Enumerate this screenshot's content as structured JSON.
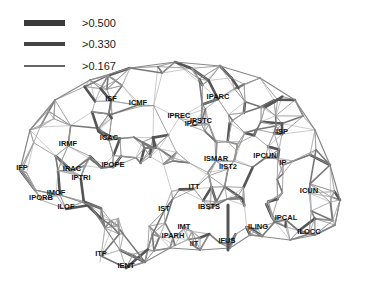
{
  "legend": {
    "items": [
      {
        "label": ">0.500",
        "thickness": 6,
        "color": "#3a3a3a"
      },
      {
        "label": ">0.330",
        "thickness": 4,
        "color": "#444444"
      },
      {
        "label": ">0.167",
        "thickness": 2,
        "color": "#666666"
      }
    ]
  },
  "regions": [
    {
      "name": "ISF",
      "x": 111,
      "y": 98
    },
    {
      "name": "ICMF",
      "x": 138,
      "y": 102
    },
    {
      "name": "IPARC",
      "x": 218,
      "y": 96
    },
    {
      "name": "IPREC",
      "x": 179,
      "y": 115
    },
    {
      "name": "IPC",
      "x": 191,
      "y": 123
    },
    {
      "name": "IPSTC",
      "x": 201,
      "y": 120
    },
    {
      "name": "ISP",
      "x": 282,
      "y": 131
    },
    {
      "name": "IRMF",
      "x": 68,
      "y": 143
    },
    {
      "name": "ICAC",
      "x": 109,
      "y": 137
    },
    {
      "name": "ISMAR",
      "x": 216,
      "y": 158
    },
    {
      "name": "IIST2",
      "x": 228,
      "y": 166
    },
    {
      "name": "IPCUN",
      "x": 265,
      "y": 155
    },
    {
      "name": "IP",
      "x": 283,
      "y": 162
    },
    {
      "name": "IFP",
      "x": 22,
      "y": 167
    },
    {
      "name": "IRAC",
      "x": 72,
      "y": 168
    },
    {
      "name": "IPOPE",
      "x": 113,
      "y": 164
    },
    {
      "name": "IPTRI",
      "x": 81,
      "y": 177
    },
    {
      "name": "IMOF",
      "x": 56,
      "y": 192
    },
    {
      "name": "IPORB",
      "x": 41,
      "y": 197
    },
    {
      "name": "ILOF",
      "x": 66,
      "y": 206
    },
    {
      "name": "ITT",
      "x": 194,
      "y": 186
    },
    {
      "name": "ICUN",
      "x": 309,
      "y": 190
    },
    {
      "name": "IST",
      "x": 164,
      "y": 208
    },
    {
      "name": "IBSTS",
      "x": 209,
      "y": 206
    },
    {
      "name": "IPCAL",
      "x": 286,
      "y": 217
    },
    {
      "name": "IMT",
      "x": 184,
      "y": 226
    },
    {
      "name": "ILING",
      "x": 258,
      "y": 226
    },
    {
      "name": "ILOCC",
      "x": 309,
      "y": 231
    },
    {
      "name": "IPARH",
      "x": 173,
      "y": 235
    },
    {
      "name": "IIT",
      "x": 194,
      "y": 243
    },
    {
      "name": "IFUS",
      "x": 227,
      "y": 240
    },
    {
      "name": "ITP",
      "x": 101,
      "y": 253
    },
    {
      "name": "IENT",
      "x": 126,
      "y": 265
    }
  ]
}
